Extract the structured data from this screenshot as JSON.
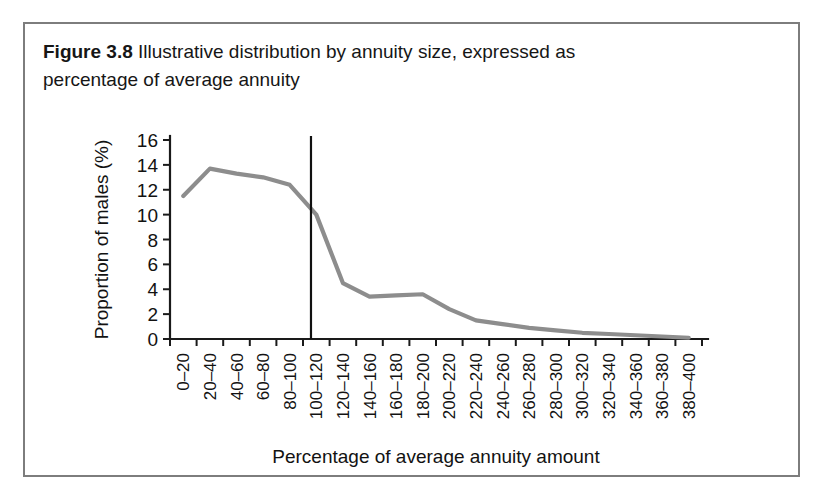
{
  "figure": {
    "label": "Figure 3.8",
    "caption": "Illustrative distribution by annuity size, expressed as percentage of average annuity"
  },
  "colors": {
    "line": "#8d8d8d",
    "axis": "#1a1a1a",
    "marker": "#111111",
    "frame": "#7d7d7d",
    "background": "#ffffff"
  },
  "chart_data": {
    "type": "line",
    "title": "Illustrative distribution by annuity size, expressed as percentage of average annuity",
    "xlabel": "Percentage of average annuity amount",
    "ylabel": "Proportion of males (%)",
    "ylim": [
      0,
      16
    ],
    "yticks": [
      0,
      2,
      4,
      6,
      8,
      10,
      12,
      14,
      16
    ],
    "grid": false,
    "legend": "none",
    "categories": [
      "0–20",
      "20–40",
      "40–60",
      "60–80",
      "80–100",
      "100–120",
      "120–140",
      "140–160",
      "160–180",
      "180–200",
      "200–220",
      "220–240",
      "240–260",
      "260–280",
      "280–300",
      "300–320",
      "320–340",
      "340–360",
      "360–380",
      "380–400"
    ],
    "values": [
      11.5,
      13.7,
      13.3,
      13.0,
      12.4,
      10.0,
      4.5,
      3.4,
      3.5,
      3.6,
      2.4,
      1.5,
      1.2,
      0.9,
      0.7,
      0.5,
      0.4,
      0.3,
      0.2,
      0.1
    ],
    "annotations": [
      {
        "name": "average-annuity-marker",
        "type": "vline",
        "x_category_index": 4.8,
        "label": ""
      }
    ]
  }
}
